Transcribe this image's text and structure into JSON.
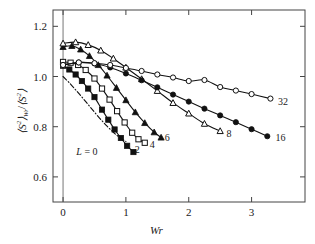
{
  "chart_data": {
    "type": "line",
    "title": "",
    "xlabel": "Wr",
    "ylabel_html": "⟨S²⟩_Wr/⟨S²⟩",
    "xlim": [
      -0.16,
      3.85
    ],
    "ylim": [
      0.5,
      1.265
    ],
    "xticks": [
      "0",
      "1",
      "2",
      "3"
    ],
    "xtick_values": [
      0,
      1,
      2,
      3
    ],
    "yticks": [
      "1.2",
      "1.0",
      "0.8",
      "0.6"
    ],
    "ytick_values": [
      1.2,
      1.0,
      0.8,
      0.6
    ],
    "grid": false,
    "legend_position": "inline-end-of-curve",
    "vertical_reference_line_x": 0,
    "series": [
      {
        "name": "L = 0",
        "label": "L = 0",
        "marker": "none",
        "linestyle": "dash-dot",
        "x": [
          0.0,
          0.1,
          0.2,
          0.3,
          0.4,
          0.5,
          0.6,
          0.7,
          0.8,
          0.9,
          1.0
        ],
        "y": [
          1.0,
          0.975,
          0.947,
          0.918,
          0.888,
          0.858,
          0.829,
          0.802,
          0.778,
          0.757,
          0.741
        ]
      },
      {
        "name": "2",
        "label": "2",
        "marker": "filled-square",
        "linestyle": "solid",
        "x": [
          0.0,
          0.1,
          0.2,
          0.3,
          0.4,
          0.5,
          0.62,
          0.72,
          0.82,
          0.92,
          1.02,
          1.12
        ],
        "y": [
          1.043,
          1.028,
          1.008,
          0.982,
          0.952,
          0.918,
          0.868,
          0.828,
          0.789,
          0.755,
          0.724,
          0.699
        ]
      },
      {
        "name": "4",
        "label": "4",
        "marker": "open-square",
        "linestyle": "solid",
        "x": [
          0.0,
          0.12,
          0.24,
          0.36,
          0.5,
          0.62,
          0.74,
          0.86,
          0.98,
          1.1,
          1.2,
          1.3
        ],
        "y": [
          1.058,
          1.055,
          1.046,
          1.026,
          0.992,
          0.952,
          0.908,
          0.862,
          0.817,
          0.776,
          0.75,
          0.736
        ]
      },
      {
        "name": "6",
        "label": "6",
        "marker": "filled-triangle",
        "linestyle": "solid",
        "x": [
          0.0,
          0.14,
          0.28,
          0.42,
          0.56,
          0.7,
          0.85,
          1.0,
          1.15,
          1.3,
          1.45,
          1.56
        ],
        "y": [
          1.118,
          1.122,
          1.108,
          1.082,
          1.046,
          1.004,
          0.955,
          0.906,
          0.858,
          0.815,
          0.778,
          0.757
        ]
      },
      {
        "name": "8",
        "label": "8",
        "marker": "open-triangle",
        "linestyle": "solid",
        "x": [
          0.0,
          0.2,
          0.4,
          0.6,
          0.8,
          1.0,
          1.25,
          1.5,
          1.75,
          2.0,
          2.25,
          2.5
        ],
        "y": [
          1.132,
          1.137,
          1.126,
          1.104,
          1.072,
          1.036,
          0.99,
          0.943,
          0.895,
          0.853,
          0.812,
          0.783
        ]
      },
      {
        "name": "16",
        "label": "16",
        "marker": "filled-circle",
        "linestyle": "solid",
        "x": [
          0.0,
          0.25,
          0.5,
          0.75,
          1.0,
          1.25,
          1.5,
          1.75,
          2.0,
          2.25,
          2.5,
          2.75,
          3.0,
          3.25
        ],
        "y": [
          1.046,
          1.056,
          1.052,
          1.036,
          1.012,
          0.985,
          0.957,
          0.928,
          0.9,
          0.872,
          0.845,
          0.818,
          0.79,
          0.762
        ]
      },
      {
        "name": "32",
        "label": "32",
        "marker": "open-circle",
        "linestyle": "solid",
        "x": [
          0.0,
          0.25,
          0.5,
          0.75,
          1.0,
          1.25,
          1.5,
          1.75,
          2.0,
          2.25,
          2.5,
          2.75,
          3.0,
          3.3
        ],
        "y": [
          1.046,
          1.056,
          1.053,
          1.046,
          1.034,
          1.022,
          1.008,
          0.996,
          0.982,
          0.986,
          0.958,
          0.944,
          0.93,
          0.912
        ]
      }
    ],
    "series_labels": [
      {
        "text": "L = 0",
        "x": 0.38,
        "y": 0.705,
        "italic_prefix": "L"
      },
      {
        "text": "2",
        "x": 1.14,
        "y": 0.712
      },
      {
        "text": "4",
        "x": 1.38,
        "y": 0.733
      },
      {
        "text": "6",
        "x": 1.62,
        "y": 0.76
      },
      {
        "text": "8",
        "x": 2.6,
        "y": 0.776
      },
      {
        "text": "16",
        "x": 3.38,
        "y": 0.758
      },
      {
        "text": "32",
        "x": 3.42,
        "y": 0.904
      }
    ],
    "colors": {
      "line": "#111111",
      "marker_fill": "#111111",
      "marker_open": "#ffffff",
      "axis": "#444444"
    }
  }
}
